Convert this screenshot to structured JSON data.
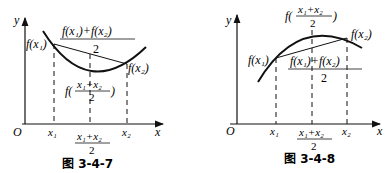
{
  "figures": [
    {
      "id": "fig-3-4-7",
      "caption": "图 3-4-7",
      "curve": "convex (opens upward)",
      "labels": {
        "y_axis": "y",
        "x_axis": "x",
        "origin": "O",
        "x1": "x₁",
        "x2": "x₂",
        "mid_num": "x₁+x₂",
        "mid_den": "2",
        "f_x1": "f(x₁)",
        "f_x2": "f(x₂)",
        "avg_num": "f(x₁)+f(x₂)",
        "avg_den": "2",
        "f_mid_prefix": "f(",
        "f_mid_suffix": ")"
      }
    },
    {
      "id": "fig-3-4-8",
      "caption": "图 3-4-8",
      "curve": "concave (opens downward)",
      "labels": {
        "y_axis": "y",
        "x_axis": "x",
        "origin": "O",
        "x1": "x₁",
        "x2": "x₂",
        "mid_num": "x₁+x₂",
        "mid_den": "2",
        "f_x1": "f(x₁)",
        "f_x2": "f(x₂)",
        "avg_num": "f(x₁)+f(x₂)",
        "avg_den": "2",
        "f_mid_prefix": "f(",
        "f_mid_suffix": ")"
      }
    }
  ]
}
